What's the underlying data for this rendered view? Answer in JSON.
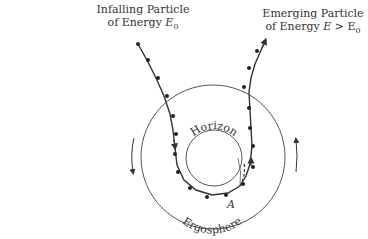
{
  "diagram": {
    "type": "penrose-process",
    "labels": {
      "infalling": {
        "line1": "Infalling Particle",
        "line2_prefix": "of Energy ",
        "line2_symbol": "E",
        "line2_sub": "0"
      },
      "emerging": {
        "line1": "Emerging Particle",
        "line2_prefix": "of Energy ",
        "line2_symbol": "E",
        "line2_rel": " > E",
        "line2_sub": "0"
      },
      "horizon": "Horizon",
      "ergosphere": "Ergosphere",
      "point_a": "A"
    },
    "regions": [
      {
        "name": "horizon",
        "shape": "circle",
        "center": [
          214,
          158
        ],
        "radius": 28
      },
      {
        "name": "ergosphere-boundary",
        "shape": "circle",
        "center": [
          213,
          157
        ],
        "radius": 72
      }
    ],
    "rotation_arrows": [
      {
        "side": "left",
        "direction": "down"
      },
      {
        "side": "right",
        "direction": "up"
      }
    ],
    "colors": {
      "line": "#333333",
      "circle": "#555555",
      "background": "#ffffff"
    }
  }
}
